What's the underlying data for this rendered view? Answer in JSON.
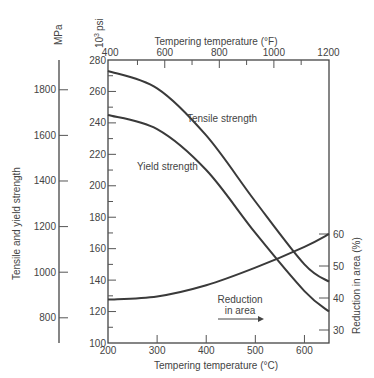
{
  "chart_data": {
    "type": "line",
    "title": "",
    "xlabel": "Tempering temperature (°C)",
    "xlabel_top": "Tempering temperature (°F)",
    "ylabel_left_outer": "Tensile and yield strength",
    "ylabel_left_outer_units": "MPa",
    "ylabel_left_inner_units": "10³ psi",
    "ylabel_right": "Reduction in area (%)",
    "x": [
      200,
      300,
      400,
      500,
      600,
      650
    ],
    "xlim": [
      200,
      650
    ],
    "x_ticks": [
      200,
      300,
      400,
      500,
      600
    ],
    "x_top_ticks": [
      400,
      600,
      800,
      1000,
      1200
    ],
    "ylim_psi": [
      100,
      280
    ],
    "y_psi_ticks": [
      100,
      120,
      140,
      160,
      180,
      200,
      220,
      240,
      260,
      280
    ],
    "y_mpa_ticks": [
      800,
      1000,
      1200,
      1400,
      1600,
      1800
    ],
    "y_right_ticks": [
      30,
      40,
      50,
      60
    ],
    "grid": false,
    "series": [
      {
        "name": "Tensile strength",
        "axis": "10³ psi",
        "values": [
          273,
          262,
          232,
          190,
          150,
          139
        ]
      },
      {
        "name": "Yield strength",
        "axis": "10³ psi",
        "values": [
          245,
          236,
          210,
          170,
          133,
          120
        ]
      },
      {
        "name": "Reduction in area",
        "axis": "Reduction in area (%)",
        "values": [
          39.5,
          40.5,
          44,
          49.5,
          56,
          60
        ]
      }
    ],
    "annotations": [
      "Tensile strength",
      "Yield strength",
      "Reduction in area →"
    ]
  },
  "labels": {
    "mpa": "MPa",
    "psi_base": "10",
    "psi_exp": "3",
    "psi_unit": "psi",
    "top_title": "Tempering temperature (°F)",
    "bottom_title": "Tempering temperature (°C)",
    "left_title": "Tensile and yield strength",
    "right_title": "Reduction in area (%)",
    "tensile": "Tensile strength",
    "yield": "Yield strength",
    "reduction_line1": "Reduction",
    "reduction_line2": "in area"
  }
}
